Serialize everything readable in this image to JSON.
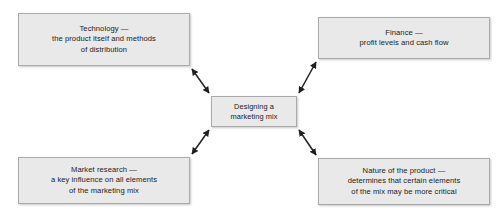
{
  "diagram": {
    "title": "Designing a marketing mix",
    "background_color": "#ffffff",
    "box_fill_color": "#e9e9e9",
    "box_border_color": "#a9a9a9",
    "arrow_color": "#231f20",
    "center": {
      "id": "center",
      "text": "Designing a\nmarketing mix"
    },
    "nodes": [
      {
        "id": "technology",
        "position": "top-left",
        "text": "Technology —\nthe product itself and methods\nof distribution"
      },
      {
        "id": "finance",
        "position": "top-right",
        "text": "Finance —\nprofit levels and cash flow"
      },
      {
        "id": "market-research",
        "position": "bottom-left",
        "text": "Market research —\na key influence on all elements\nof the marketing mix"
      },
      {
        "id": "nature-of-product",
        "position": "bottom-right",
        "text": "Nature of the product —\ndetermines that certain elements\nof the mix may be more critical"
      }
    ],
    "connectors": [
      {
        "id": "technology-center",
        "from": "technology",
        "to": "center",
        "style": "double-headed-arrow"
      },
      {
        "id": "finance-center",
        "from": "finance",
        "to": "center",
        "style": "double-headed-arrow"
      },
      {
        "id": "market-research-center",
        "from": "market-research",
        "to": "center",
        "style": "double-headed-arrow"
      },
      {
        "id": "nature-of-product-center",
        "from": "nature-of-product",
        "to": "center",
        "style": "double-headed-arrow"
      }
    ]
  }
}
